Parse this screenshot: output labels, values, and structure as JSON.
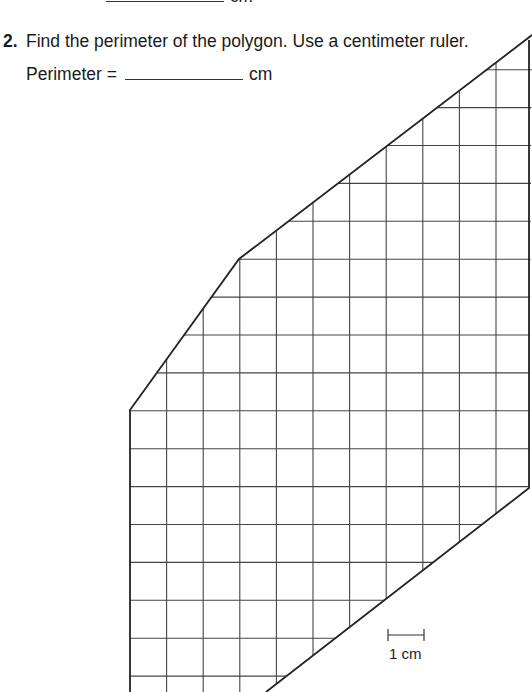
{
  "previous_question": {
    "text_before": "Perimeter of polygon =",
    "unit": "cm"
  },
  "question": {
    "number": "2.",
    "text": "Find the perimeter of the polygon. Use a centimeter ruler.",
    "answer_label": "Perimeter =",
    "answer_value": "",
    "answer_unit": "cm"
  },
  "figure": {
    "type": "polygon on centimeter grid",
    "vertices": [
      [
        130,
        410
      ],
      [
        239,
        259
      ],
      [
        532,
        35
      ],
      [
        529,
        488
      ],
      [
        266,
        692
      ],
      [
        130,
        692
      ]
    ],
    "grid_spacing_px": {
      "x": 36.6,
      "y": 37.9
    },
    "line_color": "#222222",
    "grid_color": "#444444",
    "scale_bar": {
      "label": "1 cm",
      "x1": 388,
      "x2": 424,
      "y": 635
    }
  }
}
